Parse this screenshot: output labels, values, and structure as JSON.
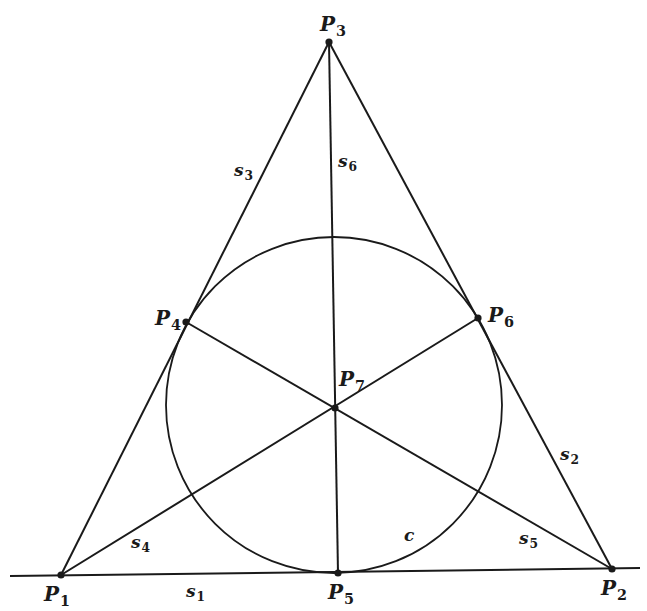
{
  "diagram": {
    "title": "",
    "type": "Fano plane",
    "stroke_color": "#1a1a1a",
    "background": "#ffffff",
    "points": [
      {
        "id": "P1",
        "name": "P",
        "sub": "1",
        "x": 61,
        "y": 575,
        "lx": 44,
        "ly": 584
      },
      {
        "id": "P2",
        "name": "P",
        "sub": "2",
        "x": 612,
        "y": 569,
        "lx": 601,
        "ly": 578
      },
      {
        "id": "P3",
        "name": "P",
        "sub": "3",
        "x": 329,
        "y": 42,
        "lx": 320,
        "ly": 14
      },
      {
        "id": "P4",
        "name": "P",
        "sub": "4",
        "x": 186,
        "y": 322,
        "lx": 155,
        "ly": 308
      },
      {
        "id": "P5",
        "name": "P",
        "sub": "5",
        "x": 338,
        "y": 573,
        "lx": 328,
        "ly": 582
      },
      {
        "id": "P6",
        "name": "P",
        "sub": "6",
        "x": 478,
        "y": 318,
        "lx": 488,
        "ly": 305
      },
      {
        "id": "P7",
        "name": "P",
        "sub": "7",
        "x": 335,
        "y": 408,
        "lx": 339,
        "ly": 369
      }
    ],
    "lines": [
      {
        "id": "s1",
        "name": "s",
        "sub": "1",
        "from": [
          10,
          576
        ],
        "to": [
          640,
          568
        ],
        "lx": 186,
        "ly": 583
      },
      {
        "id": "s2",
        "name": "s",
        "sub": "2",
        "from": [
          329,
          42
        ],
        "to": [
          612,
          569
        ],
        "lx": 560,
        "ly": 446
      },
      {
        "id": "s3",
        "name": "s",
        "sub": "3",
        "from": [
          329,
          42
        ],
        "to": [
          61,
          575
        ],
        "lx": 234,
        "ly": 162
      },
      {
        "id": "s4",
        "name": "s",
        "sub": "4",
        "from": [
          61,
          575
        ],
        "to": [
          478,
          318
        ],
        "lx": 131,
        "ly": 534
      },
      {
        "id": "s5",
        "name": "s",
        "sub": "5",
        "from": [
          186,
          322
        ],
        "to": [
          612,
          569
        ],
        "lx": 519,
        "ly": 530
      },
      {
        "id": "s6",
        "name": "s",
        "sub": "6",
        "from": [
          329,
          42
        ],
        "to": [
          338,
          573
        ],
        "lx": 338,
        "ly": 153
      }
    ],
    "circle": {
      "id": "c",
      "name": "c",
      "cx": 334,
      "cy": 405,
      "r": 168,
      "lx": 404,
      "ly": 527
    }
  }
}
